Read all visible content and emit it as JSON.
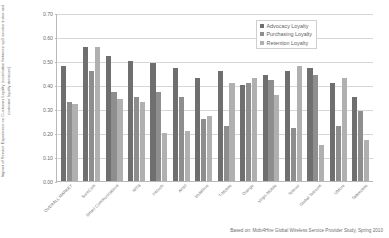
{
  "chart_data": {
    "type": "bar",
    "title": "",
    "xlabel": "",
    "ylabel": "Impact of Service Experience on Customer Loyalty (correlation between sp3 service index and customer loyalty measure)",
    "ylim": [
      0.0,
      0.7
    ],
    "ytick_labels": [
      "0.70",
      "0.60",
      "0.50",
      "0.40",
      "0.30",
      "0.20",
      "0.10",
      "0.00"
    ],
    "ytick_values": [
      0.7,
      0.6,
      0.5,
      0.4,
      0.3,
      0.2,
      0.1,
      0.0
    ],
    "grid": true,
    "legend_position": "top-right",
    "categories": [
      "OVERALL MARKET",
      "SureCom",
      "Smart Communications",
      "MTN",
      "Intouch",
      "Airtel",
      "Vodafone",
      "T-Mobile",
      "Orange",
      "Virgin Mobile",
      "Telenor",
      "Global Telecom",
      "UMore",
      "Talkmobile"
    ],
    "series": [
      {
        "name": "Advocacy Loyalty",
        "color": "#6f6f6f",
        "values": [
          0.48,
          0.56,
          0.52,
          0.5,
          0.49,
          0.47,
          0.43,
          0.46,
          0.4,
          0.44,
          0.46,
          0.47,
          0.41,
          0.35
        ]
      },
      {
        "name": "Purchasing Loyalty",
        "color": "#8e8e8e",
        "values": [
          0.33,
          0.46,
          0.37,
          0.35,
          0.37,
          0.35,
          0.26,
          0.23,
          0.41,
          0.42,
          0.22,
          0.44,
          0.23,
          0.29
        ]
      },
      {
        "name": "Retention Loyalty",
        "color": "#b0b0b0",
        "values": [
          0.32,
          0.56,
          0.34,
          0.33,
          0.2,
          0.21,
          0.27,
          0.41,
          0.43,
          0.36,
          0.48,
          0.15,
          0.43,
          0.17
        ]
      }
    ]
  },
  "legend": {
    "items": [
      {
        "label": "Advocacy Loyalty"
      },
      {
        "label": "Purchasing Loyalty"
      },
      {
        "label": "Retention Loyalty"
      }
    ]
  },
  "footer": {
    "source": "Based on: Mobi4Hire Global Wireless Service Provider Study, Spring 2010"
  }
}
